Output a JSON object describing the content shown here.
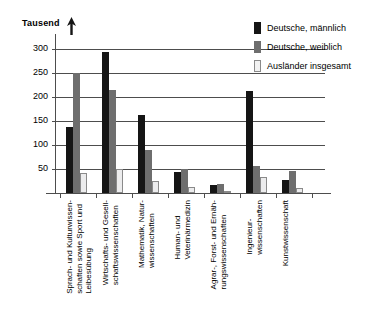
{
  "chart_data": {
    "type": "bar",
    "title": "",
    "subtitle": "",
    "xlabel": "",
    "ylabel": "Tausend",
    "ylim": [
      0,
      320
    ],
    "yticks": [
      50,
      100,
      150,
      200,
      250,
      300
    ],
    "ytick_labels": [
      "50",
      "100",
      "150",
      "200",
      "250",
      "300"
    ],
    "grid": true,
    "legend_position": "top-right",
    "categories": [
      "Sprach- und Kulturwissen-\nschaften sowie Sport und\nLeibesübung",
      "Wirtschafts- und Gesell-\nschaftswissenschaften",
      "Mathematik, Natur-\nwissenschaften",
      "Human- und\nVeterinärmedizin",
      "Agrar-, Forst- und Ernäh-\nrungswissenschaften",
      "Ingenieur-\nwissenschaften",
      "Kunstwissenschaft"
    ],
    "series": [
      {
        "name": "Deutsche, männlich",
        "color": "#151515",
        "values": [
          137,
          293,
          162,
          43,
          16,
          212,
          27
        ]
      },
      {
        "name": "Deutsche, weiblich",
        "color": "#6e6e6e",
        "values": [
          250,
          214,
          89,
          51,
          19,
          56,
          45
        ]
      },
      {
        "name": "Ausländer insgesamt",
        "color": "#ececed",
        "values": [
          42,
          50,
          24,
          13,
          5,
          34,
          11
        ]
      }
    ]
  },
  "axis": {
    "unit_label": "Tausend",
    "arrow_icon": "up-arrow-icon"
  },
  "legend": {
    "items": [
      {
        "label": "Deutsche, männlich"
      },
      {
        "label": "Deutsche, weiblich"
      },
      {
        "label": "Ausländer insgesamt"
      }
    ]
  }
}
